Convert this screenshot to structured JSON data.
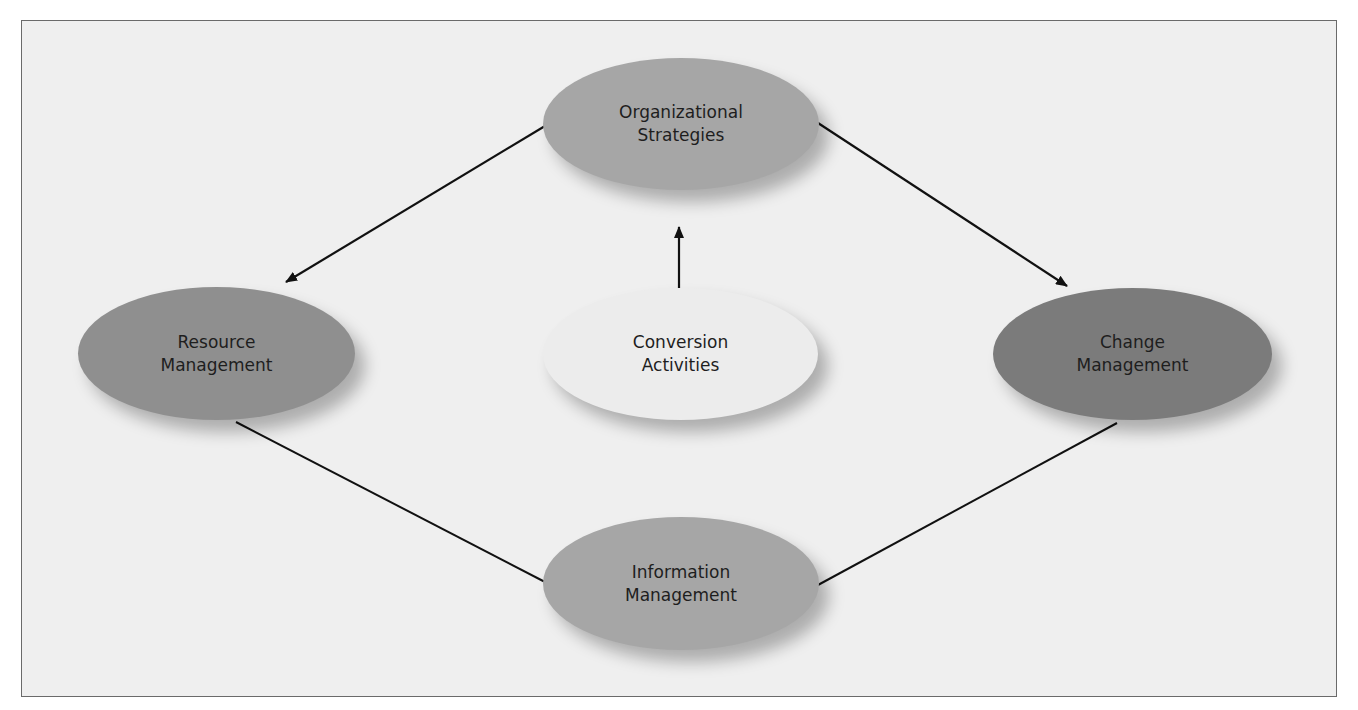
{
  "diagram": {
    "type": "flow",
    "nodes": [
      {
        "id": "organizational",
        "line1": "Organizational",
        "line2": "Strategies",
        "fill": "#a6a6a6"
      },
      {
        "id": "resource",
        "line1": "Resource",
        "line2": "Management",
        "fill": "#8f8f8f"
      },
      {
        "id": "conversion",
        "line1": "Conversion",
        "line2": "Activities",
        "fill": "#ececec"
      },
      {
        "id": "change",
        "line1": "Change",
        "line2": "Management",
        "fill": "#7b7b7b"
      },
      {
        "id": "information",
        "line1": "Information",
        "line2": "Management",
        "fill": "#a6a6a6"
      }
    ],
    "edges": [
      {
        "from": "organizational",
        "to": "resource",
        "arrow": true
      },
      {
        "from": "organizational",
        "to": "change",
        "arrow": true
      },
      {
        "from": "conversion",
        "to": "organizational",
        "arrow": true
      },
      {
        "from": "resource",
        "to": "information",
        "arrow": false
      },
      {
        "from": "change",
        "to": "information",
        "arrow": false
      }
    ]
  }
}
